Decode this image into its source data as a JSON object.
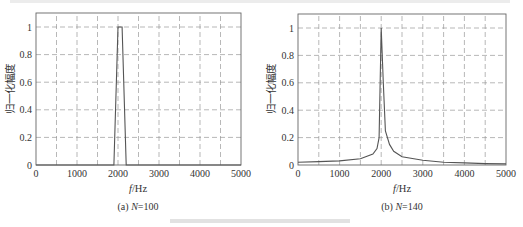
{
  "figure": {
    "caption": "",
    "top_text_partial": ""
  },
  "chart_data": [
    {
      "type": "line",
      "title": "",
      "subcaption": "(a) N=100",
      "subcaption_prefix": "(a) ",
      "subcaption_var": "N",
      "subcaption_value": "=100",
      "xlabel": "f/Hz",
      "xlabel_var": "f",
      "xlabel_unit": "/Hz",
      "ylabel": "归一化幅度",
      "xlim": [
        0,
        5000
      ],
      "ylim": [
        0,
        1.1
      ],
      "xticks": [
        "0",
        "1000",
        "2000",
        "3000",
        "4000",
        "5000"
      ],
      "yticks": [
        "0",
        "0.2",
        "0.4",
        "0.6",
        "0.8",
        "1"
      ],
      "grid": true,
      "series": [
        {
          "name": "normalized-amplitude",
          "x": [
            0,
            1900,
            2000,
            2100,
            2200,
            5000
          ],
          "y": [
            0,
            0,
            1,
            1,
            0,
            0
          ]
        }
      ]
    },
    {
      "type": "line",
      "title": "",
      "subcaption": "(b) N=140",
      "subcaption_prefix": "(b) ",
      "subcaption_var": "N",
      "subcaption_value": "=140",
      "xlabel": "f/Hz",
      "xlabel_var": "f",
      "xlabel_unit": "/Hz",
      "ylabel": "归一化幅度",
      "xlim": [
        0,
        5000
      ],
      "ylim": [
        0,
        1.1
      ],
      "xticks": [
        "0",
        "1000",
        "2000",
        "3000",
        "4000",
        "5000"
      ],
      "yticks": [
        "0",
        "0.2",
        "0.4",
        "0.6",
        "0.8",
        "1"
      ],
      "grid": true,
      "series": [
        {
          "name": "normalized-amplitude",
          "x": [
            0,
            500,
            1000,
            1500,
            1800,
            1900,
            1950,
            2000,
            2050,
            2100,
            2200,
            2300,
            2500,
            3000,
            3500,
            4000,
            4500,
            5000
          ],
          "y": [
            0.02,
            0.025,
            0.03,
            0.045,
            0.08,
            0.12,
            0.2,
            1.0,
            0.6,
            0.25,
            0.15,
            0.1,
            0.06,
            0.035,
            0.02,
            0.015,
            0.01,
            0.008
          ]
        }
      ]
    }
  ]
}
